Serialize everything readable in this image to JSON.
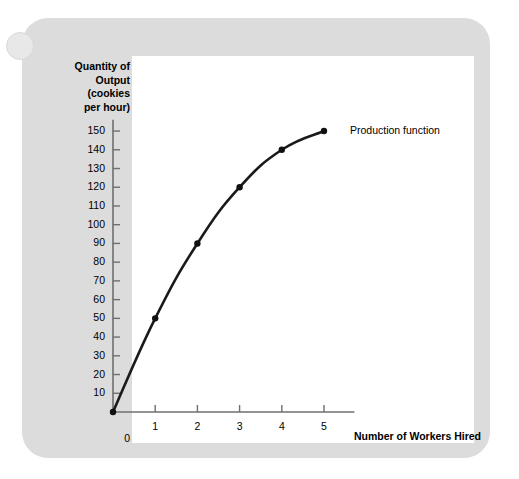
{
  "figure": {
    "panel_color": "#dcdcdc",
    "plot_background": "#ffffff",
    "line_color": "#1a1a1a"
  },
  "chart_data": {
    "type": "line",
    "title": "",
    "xlabel": "Number of Workers Hired",
    "ylabel": "Quantity of Output\n(cookies\nper hour)",
    "ylabel_lines": [
      "Quantity of",
      "Output",
      "(cookies",
      "per hour)"
    ],
    "series": [
      {
        "name": "Production function",
        "x": [
          0,
          1,
          2,
          3,
          4,
          5
        ],
        "values": [
          0,
          50,
          90,
          120,
          140,
          150
        ]
      }
    ],
    "annotations": [
      "Production function"
    ],
    "x": [
      0,
      1,
      2,
      3,
      4,
      5
    ],
    "xtick_labels": [
      "0",
      "1",
      "2",
      "3",
      "4",
      "5"
    ],
    "ytick_labels": [
      "10",
      "20",
      "30",
      "40",
      "50",
      "60",
      "70",
      "80",
      "90",
      "100",
      "110",
      "120",
      "130",
      "140",
      "150"
    ],
    "ytick_values": [
      10,
      20,
      30,
      40,
      50,
      60,
      70,
      80,
      90,
      100,
      110,
      120,
      130,
      140,
      150
    ],
    "origin_label": "0",
    "xlim": [
      0,
      5.2
    ],
    "ylim": [
      0,
      155
    ],
    "grid": false,
    "legend": "inline-annotation",
    "legend_position": "right of final data point",
    "markers": true
  }
}
